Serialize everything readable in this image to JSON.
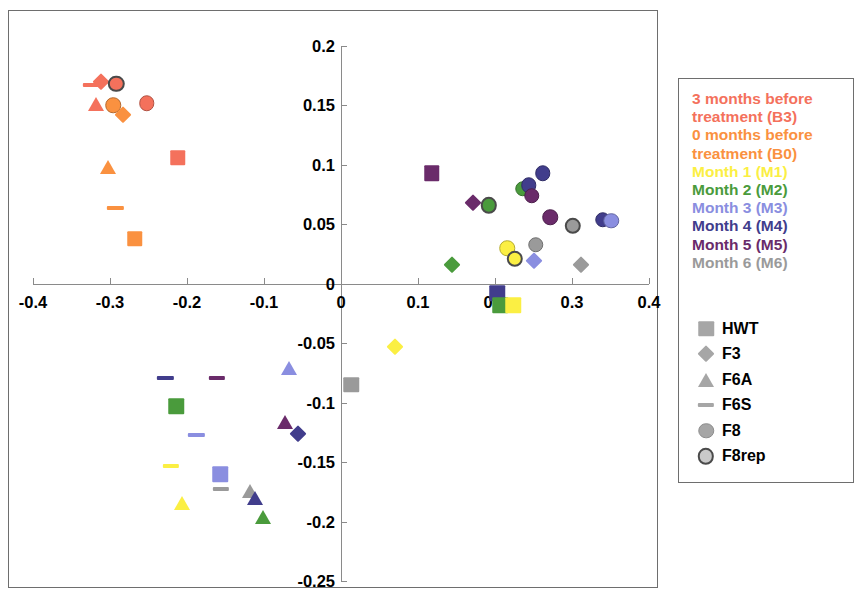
{
  "chart_data": {
    "type": "scatter",
    "title": "",
    "xlabel": "",
    "ylabel": "",
    "xlim": [
      -0.4,
      0.4
    ],
    "ylim": [
      -0.25,
      0.2
    ],
    "xticks": [
      "-0.4",
      "-0.3",
      "-0.2",
      "-0.1",
      "0",
      "0.1",
      "0.2",
      "0.3",
      "0.4"
    ],
    "xtick_values": [
      -0.4,
      -0.3,
      -0.2,
      -0.1,
      0,
      0.1,
      0.2,
      0.3,
      0.4
    ],
    "yticks": [
      "0.2",
      "0.15",
      "0.1",
      "0.05",
      "0",
      "-0.05",
      "-0.1",
      "-0.15",
      "-0.2",
      "-0.25"
    ],
    "ytick_values": [
      0.2,
      0.15,
      0.1,
      0.05,
      0,
      -0.05,
      -0.1,
      -0.15,
      -0.2,
      -0.25
    ],
    "grid": false,
    "legend_position": "right",
    "color_groups": [
      {
        "key": "B3",
        "label": "3 months before\ntreatment (B3)",
        "color": "#f4715c"
      },
      {
        "key": "B0",
        "label": "0 months before\ntreatment (B0)",
        "color": "#fa9140"
      },
      {
        "key": "M1",
        "label": "Month 1 (M1)",
        "color": "#fbef43"
      },
      {
        "key": "M2",
        "label": "Month 2 (M2)",
        "color": "#4a9b3c"
      },
      {
        "key": "M3",
        "label": "Month 3 (M3)",
        "color": "#8a8ee0"
      },
      {
        "key": "M4",
        "label": "Month 4 (M4)",
        "color": "#413d8c"
      },
      {
        "key": "M5",
        "label": "Month 5 (M5)",
        "color": "#6a2b6a"
      },
      {
        "key": "M6",
        "label": "Month 6 (M6)",
        "color": "#9a9a9a"
      }
    ],
    "shape_groups": [
      {
        "key": "HWT",
        "label": "HWT",
        "shape": "square"
      },
      {
        "key": "F3",
        "label": "F3",
        "shape": "diamond"
      },
      {
        "key": "F6A",
        "label": "F6A",
        "shape": "triangle"
      },
      {
        "key": "F6S",
        "label": "F6S",
        "shape": "dash"
      },
      {
        "key": "F8",
        "label": "F8",
        "shape": "circle"
      },
      {
        "key": "F8rep",
        "label": "F8rep",
        "shape": "ring"
      }
    ],
    "points": [
      {
        "x": -0.325,
        "y": 0.167,
        "group": "B3",
        "shape": "dash"
      },
      {
        "x": -0.312,
        "y": 0.17,
        "group": "B3",
        "shape": "diamond"
      },
      {
        "x": -0.292,
        "y": 0.168,
        "group": "B3",
        "shape": "ring"
      },
      {
        "x": -0.252,
        "y": 0.152,
        "group": "B3",
        "shape": "circle"
      },
      {
        "x": -0.318,
        "y": 0.151,
        "group": "B3",
        "shape": "triangle"
      },
      {
        "x": -0.296,
        "y": 0.15,
        "group": "B0",
        "shape": "circle"
      },
      {
        "x": -0.283,
        "y": 0.142,
        "group": "B0",
        "shape": "diamond"
      },
      {
        "x": -0.212,
        "y": 0.106,
        "group": "B3",
        "shape": "square"
      },
      {
        "x": -0.303,
        "y": 0.098,
        "group": "B0",
        "shape": "triangle"
      },
      {
        "x": -0.293,
        "y": 0.064,
        "group": "B0",
        "shape": "dash"
      },
      {
        "x": -0.268,
        "y": 0.038,
        "group": "B0",
        "shape": "square"
      },
      {
        "x": 0.118,
        "y": 0.093,
        "group": "M5",
        "shape": "square"
      },
      {
        "x": 0.172,
        "y": 0.068,
        "group": "M5",
        "shape": "diamond"
      },
      {
        "x": 0.192,
        "y": 0.066,
        "group": "M2",
        "shape": "ring"
      },
      {
        "x": 0.144,
        "y": 0.016,
        "group": "M2",
        "shape": "diamond"
      },
      {
        "x": 0.236,
        "y": 0.08,
        "group": "M2",
        "shape": "circle"
      },
      {
        "x": 0.244,
        "y": 0.083,
        "group": "M4",
        "shape": "circle"
      },
      {
        "x": 0.248,
        "y": 0.074,
        "group": "M5",
        "shape": "circle"
      },
      {
        "x": 0.262,
        "y": 0.093,
        "group": "M4",
        "shape": "circle"
      },
      {
        "x": 0.272,
        "y": 0.056,
        "group": "M5",
        "shape": "circle"
      },
      {
        "x": 0.301,
        "y": 0.049,
        "group": "M6",
        "shape": "ring"
      },
      {
        "x": 0.34,
        "y": 0.054,
        "group": "M4",
        "shape": "circle"
      },
      {
        "x": 0.351,
        "y": 0.053,
        "group": "M3",
        "shape": "circle"
      },
      {
        "x": 0.253,
        "y": 0.033,
        "group": "M6",
        "shape": "circle"
      },
      {
        "x": 0.216,
        "y": 0.03,
        "group": "M1",
        "shape": "circle"
      },
      {
        "x": 0.226,
        "y": 0.021,
        "group": "M1",
        "shape": "ring"
      },
      {
        "x": 0.25,
        "y": 0.019,
        "group": "M3",
        "shape": "diamond"
      },
      {
        "x": 0.312,
        "y": 0.016,
        "group": "M6",
        "shape": "diamond"
      },
      {
        "x": 0.203,
        "y": -0.008,
        "group": "M4",
        "shape": "square"
      },
      {
        "x": 0.207,
        "y": -0.018,
        "group": "M2",
        "shape": "square"
      },
      {
        "x": 0.224,
        "y": -0.018,
        "group": "M1",
        "shape": "square"
      },
      {
        "x": 0.07,
        "y": -0.053,
        "group": "M1",
        "shape": "diamond"
      },
      {
        "x": -0.067,
        "y": -0.071,
        "group": "M3",
        "shape": "triangle"
      },
      {
        "x": -0.228,
        "y": -0.079,
        "group": "M4",
        "shape": "dash"
      },
      {
        "x": -0.161,
        "y": -0.079,
        "group": "M5",
        "shape": "dash"
      },
      {
        "x": 0.013,
        "y": -0.085,
        "group": "M6",
        "shape": "square"
      },
      {
        "x": -0.214,
        "y": -0.103,
        "group": "M2",
        "shape": "square"
      },
      {
        "x": -0.073,
        "y": -0.116,
        "group": "M5",
        "shape": "triangle"
      },
      {
        "x": -0.056,
        "y": -0.126,
        "group": "M4",
        "shape": "diamond"
      },
      {
        "x": -0.188,
        "y": -0.127,
        "group": "M3",
        "shape": "dash"
      },
      {
        "x": -0.221,
        "y": -0.153,
        "group": "M1",
        "shape": "dash"
      },
      {
        "x": -0.157,
        "y": -0.16,
        "group": "M3",
        "shape": "square"
      },
      {
        "x": -0.156,
        "y": -0.173,
        "group": "M6",
        "shape": "dash"
      },
      {
        "x": -0.118,
        "y": -0.174,
        "group": "M6",
        "shape": "triangle"
      },
      {
        "x": -0.112,
        "y": -0.18,
        "group": "M4",
        "shape": "triangle"
      },
      {
        "x": -0.207,
        "y": -0.184,
        "group": "M1",
        "shape": "triangle"
      },
      {
        "x": -0.101,
        "y": -0.196,
        "group": "M2",
        "shape": "triangle"
      }
    ]
  }
}
